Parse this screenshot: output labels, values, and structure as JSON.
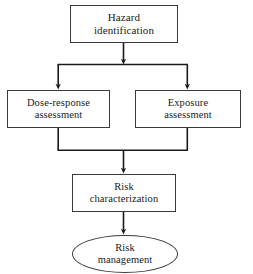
{
  "diagram": {
    "background_color": "#ffffff",
    "stroke_color": "#3a3a3a",
    "edge_color": "#1a1a1a",
    "text_color": "#1a1a1a",
    "nodes": [
      {
        "id": "hazard-identification",
        "shape": "rectangle",
        "label": "Hazard\nidentification",
        "line1": "Hazard",
        "line2": "identification"
      },
      {
        "id": "dose-response-assessment",
        "shape": "rectangle",
        "label": "Dose-response\nassessment",
        "line1": "Dose-response",
        "line2": "assessment"
      },
      {
        "id": "exposure-assessment",
        "shape": "rectangle",
        "label": "Exposure\nassessment",
        "line1": "Exposure",
        "line2": "assessment"
      },
      {
        "id": "risk-characterization",
        "shape": "rectangle",
        "label": "Risk\ncharacterization",
        "line1": "Risk",
        "line2": "characterization"
      },
      {
        "id": "risk-management",
        "shape": "ellipse",
        "label": "Risk\nmanagement",
        "line1": "Risk",
        "line2": "management"
      }
    ],
    "edges": [
      {
        "id": "hazard-to-split",
        "from": "hazard-identification",
        "to": "split-bar",
        "arrowhead": true
      },
      {
        "id": "split-to-dose-response",
        "from": "split-bar",
        "to": "dose-response-assessment",
        "arrowhead": true
      },
      {
        "id": "split-to-exposure",
        "from": "split-bar",
        "to": "exposure-assessment",
        "arrowhead": true
      },
      {
        "id": "dose-response-to-merge",
        "from": "dose-response-assessment",
        "to": "merge-bar",
        "arrowhead": false
      },
      {
        "id": "exposure-to-merge",
        "from": "exposure-assessment",
        "to": "merge-bar",
        "arrowhead": false
      },
      {
        "id": "merge-to-risk-characterization",
        "from": "merge-bar",
        "to": "risk-characterization",
        "arrowhead": true
      },
      {
        "id": "risk-characterization-to-risk-management",
        "from": "risk-characterization",
        "to": "risk-management",
        "arrowhead": true
      }
    ]
  }
}
